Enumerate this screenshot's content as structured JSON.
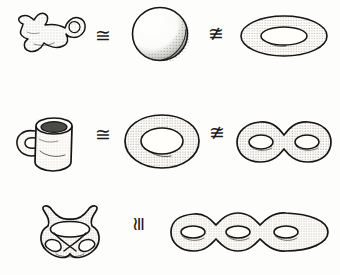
{
  "figure": {
    "background_color": "#fdfdfc",
    "ink_color": "#151515",
    "style": "pen-and-ink stipple drawing",
    "width": 340,
    "height": 275
  },
  "rows": [
    {
      "id": "row-1",
      "shapes": [
        {
          "name": "blob-with-curled-tail",
          "label": "amoeba blob",
          "genus": 0
        },
        {
          "name": "sphere",
          "label": "sphere",
          "genus": 0
        },
        {
          "name": "torus",
          "label": "torus",
          "genus": 1
        }
      ],
      "relations": [
        {
          "name": "congruent",
          "symbol": "≅",
          "meaning": "homeomorphic",
          "rotated": false
        },
        {
          "name": "not-congruent",
          "symbol": "≇",
          "meaning": "not homeomorphic",
          "rotated": false
        }
      ]
    },
    {
      "id": "row-2",
      "shapes": [
        {
          "name": "coffee-mug",
          "label": "coffee mug",
          "genus": 1
        },
        {
          "name": "torus",
          "label": "torus",
          "genus": 1
        },
        {
          "name": "double-torus",
          "label": "genus-2 surface",
          "genus": 2
        }
      ],
      "relations": [
        {
          "name": "congruent",
          "symbol": "≅",
          "meaning": "homeomorphic",
          "rotated": false
        },
        {
          "name": "not-congruent",
          "symbol": "≇",
          "meaning": "not homeomorphic",
          "rotated": false
        }
      ]
    },
    {
      "id": "row-3",
      "shapes": [
        {
          "name": "knotted-genus-3-surface",
          "label": "knotted three-holed surface",
          "genus": 3
        },
        {
          "name": "triple-torus",
          "label": "genus-3 surface",
          "genus": 3
        }
      ],
      "relations": [
        {
          "name": "congruent",
          "symbol": "≅",
          "meaning": "homeomorphic",
          "rotated": true
        }
      ]
    }
  ]
}
